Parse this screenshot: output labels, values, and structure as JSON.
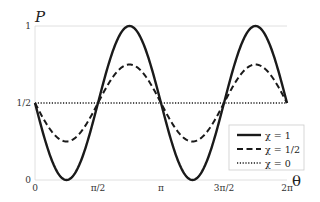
{
  "chart_data": {
    "type": "line",
    "title": "",
    "xlabel": "θ",
    "ylabel": "P",
    "xlim": [
      0,
      6.2832
    ],
    "ylim": [
      0,
      1
    ],
    "x_ticks": [
      {
        "value": 0,
        "label": "0"
      },
      {
        "value": 1.5708,
        "label": "π/2"
      },
      {
        "value": 3.1416,
        "label": "π"
      },
      {
        "value": 4.7124,
        "label": "3π/2"
      },
      {
        "value": 6.2832,
        "label": "2π"
      }
    ],
    "y_ticks": [
      {
        "value": 0,
        "label": "0"
      },
      {
        "value": 0.5,
        "label": "1/2"
      },
      {
        "value": 1,
        "label": "1"
      }
    ],
    "grid": true,
    "legend_position": "lower right",
    "function": "P(θ) = 1/2 - (χ/2)·sin(2θ)",
    "series": [
      {
        "name": "χ = 1",
        "chi": 1,
        "style": "solid",
        "x": [
          0,
          0.7854,
          1.5708,
          2.3562,
          3.1416,
          3.927,
          4.7124,
          5.4978,
          6.2832
        ],
        "values": [
          0.5,
          0,
          0.5,
          1,
          0.5,
          0,
          0.5,
          1,
          0.5
        ]
      },
      {
        "name": "χ = 1/2",
        "chi": 0.5,
        "style": "dashed",
        "x": [
          0,
          0.7854,
          1.5708,
          2.3562,
          3.1416,
          3.927,
          4.7124,
          5.4978,
          6.2832
        ],
        "values": [
          0.5,
          0.25,
          0.5,
          0.75,
          0.5,
          0.25,
          0.5,
          0.75,
          0.5
        ]
      },
      {
        "name": "χ = 0",
        "chi": 0,
        "style": "dotted",
        "x": [
          0,
          0.7854,
          1.5708,
          2.3562,
          3.1416,
          3.927,
          4.7124,
          5.4978,
          6.2832
        ],
        "values": [
          0.5,
          0.5,
          0.5,
          0.5,
          0.5,
          0.5,
          0.5,
          0.5,
          0.5
        ]
      }
    ]
  },
  "labels": {
    "y_axis": "P",
    "x_axis": "θ"
  },
  "colors": {
    "line": "#1a1a1a",
    "grid": "#d8d8d8",
    "legend_border": "#cccccc"
  }
}
